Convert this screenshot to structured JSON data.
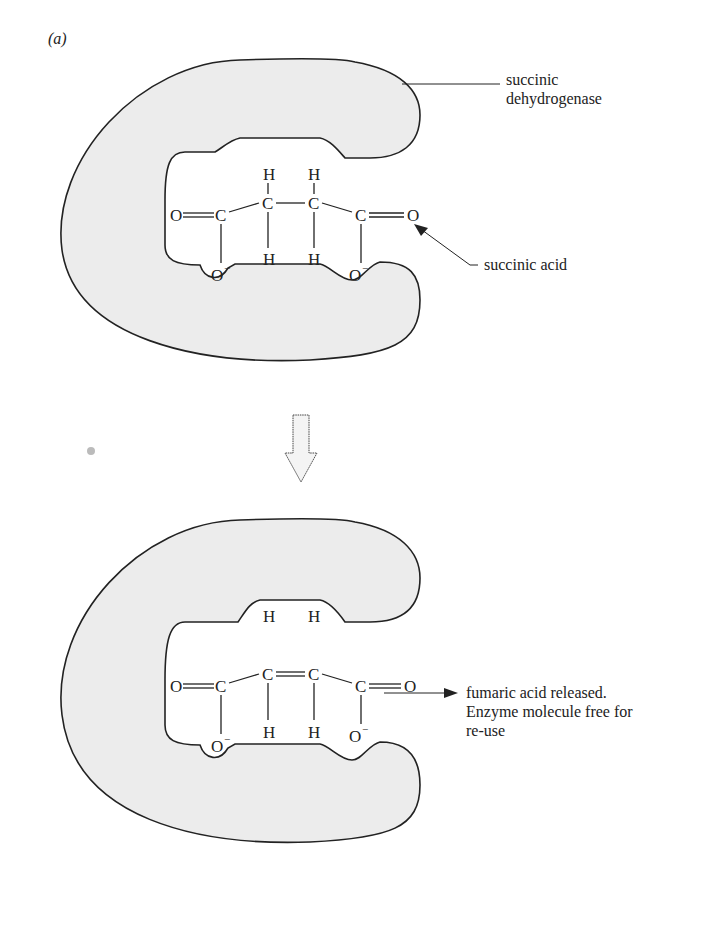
{
  "panel_label": "(a)",
  "top": {
    "enzyme_label_line1": "succinic",
    "enzyme_label_line2": "dehydrogenase",
    "substrate_label": "succinic acid",
    "molecule": {
      "name": "succinic acid",
      "atoms": {
        "o_left": "O",
        "c1": "C",
        "c2": "C",
        "c3": "C",
        "c4": "C",
        "o_right": "O",
        "h_top_1": "H",
        "h_top_2": "H",
        "h_bot_1": "H",
        "h_bot_2": "H",
        "o_minus_1": "O",
        "o_minus_2": "O",
        "charge": "−"
      }
    }
  },
  "transition_arrow": "down-arrow",
  "bottom": {
    "product_label_line1": "fumaric acid released.",
    "product_label_line2": "Enzyme molecule free for",
    "product_label_line3": "re-use",
    "free_h_1": "H",
    "free_h_2": "H",
    "molecule": {
      "name": "fumaric acid",
      "atoms": {
        "o_left": "O",
        "c1": "C",
        "c2": "C",
        "c3": "C",
        "c4": "C",
        "o_right": "O",
        "h_bot_1": "H",
        "h_bot_2": "H",
        "o_minus_1": "O",
        "o_minus_2": "O",
        "charge": "−"
      }
    }
  },
  "colors": {
    "enzyme_fill": "#ececec",
    "stroke": "#222222",
    "background": "#ffffff"
  }
}
